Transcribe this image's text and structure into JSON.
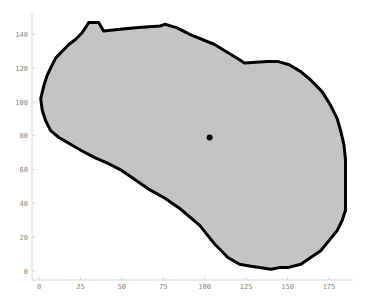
{
  "chart_data": {
    "type": "area",
    "title": "",
    "xlabel": "",
    "ylabel": "",
    "xlim": [
      -4,
      188
    ],
    "ylim": [
      -5,
      150
    ],
    "grid": false,
    "legend": null,
    "x_ticks": [
      0,
      25,
      50,
      75,
      100,
      125,
      150,
      175
    ],
    "y_ticks": [
      0,
      20,
      40,
      60,
      80,
      100,
      120,
      140
    ],
    "x_tick_labels": [
      "0",
      "25",
      "50",
      "75",
      "100",
      "125",
      "150",
      "175"
    ],
    "y_tick_labels": [
      "0",
      "20",
      "40",
      "60",
      "80",
      "100",
      "120",
      "140"
    ],
    "series": [
      {
        "name": "region",
        "kind": "filled-polygon",
        "fill": "#c4c4c4",
        "outline": "#000000",
        "points": [
          [
            30,
            147
          ],
          [
            36,
            147
          ],
          [
            39,
            142
          ],
          [
            49,
            143
          ],
          [
            60,
            144
          ],
          [
            73,
            145
          ],
          [
            76,
            146
          ],
          [
            83,
            144
          ],
          [
            91,
            140
          ],
          [
            106,
            134
          ],
          [
            121,
            125
          ],
          [
            124,
            123
          ],
          [
            138,
            124
          ],
          [
            144,
            124
          ],
          [
            151,
            122
          ],
          [
            158,
            118
          ],
          [
            164,
            113
          ],
          [
            171,
            106
          ],
          [
            176,
            98
          ],
          [
            180,
            90
          ],
          [
            182,
            83
          ],
          [
            184,
            75
          ],
          [
            185,
            66
          ],
          [
            185,
            50
          ],
          [
            185,
            36
          ],
          [
            183,
            30
          ],
          [
            180,
            24
          ],
          [
            175,
            18
          ],
          [
            170,
            12
          ],
          [
            164,
            8
          ],
          [
            158,
            4
          ],
          [
            150,
            2
          ],
          [
            145,
            2
          ],
          [
            140,
            1
          ],
          [
            133,
            2
          ],
          [
            127,
            3
          ],
          [
            121,
            4
          ],
          [
            114,
            8
          ],
          [
            106,
            16
          ],
          [
            97,
            27
          ],
          [
            85,
            37
          ],
          [
            76,
            43
          ],
          [
            67,
            48
          ],
          [
            58,
            54
          ],
          [
            49,
            60
          ],
          [
            41,
            64
          ],
          [
            34,
            67
          ],
          [
            26,
            71
          ],
          [
            19,
            75
          ],
          [
            12,
            79
          ],
          [
            7,
            83
          ],
          [
            4,
            89
          ],
          [
            2,
            95
          ],
          [
            1,
            102
          ],
          [
            3,
            110
          ],
          [
            5,
            116
          ],
          [
            7,
            120
          ],
          [
            10,
            126
          ],
          [
            14,
            130
          ],
          [
            18,
            134
          ],
          [
            22,
            137
          ],
          [
            26,
            141
          ]
        ]
      },
      {
        "name": "centroid",
        "kind": "point",
        "x": 103,
        "y": 79,
        "color": "#000000"
      }
    ]
  }
}
